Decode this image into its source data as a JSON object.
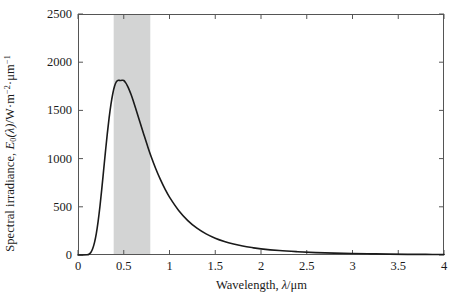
{
  "chart_data": {
    "type": "line",
    "title": "",
    "subtitle": "",
    "xlabel_parts": {
      "name": "Wavelength,",
      "symbol": "λ",
      "slash": "/",
      "unit": "μm"
    },
    "xlabel": "Wavelength, λ/μm",
    "ylabel": "Spectral irradiance, E₀(λ)/W·m⁻²·μm⁻¹",
    "ylabel_parts": {
      "name": "Spectral irradiance,",
      "symbol": "E",
      "subscript": "0",
      "arg": "(λ)",
      "slash": "/",
      "unit1": "W·m",
      "exp1": "−2",
      "dot": "·",
      "unit2": "μm",
      "exp2": "−1"
    },
    "xlim": [
      0,
      4
    ],
    "ylim": [
      0,
      2500
    ],
    "xticks": [
      0,
      0.5,
      1,
      1.5,
      2,
      2.5,
      3,
      3.5,
      4
    ],
    "xtick_labels": [
      "0",
      "0.5",
      "1",
      "1.5",
      "2",
      "2.5",
      "3",
      "3.5",
      "4"
    ],
    "yticks": [
      0,
      500,
      1000,
      1500,
      2000,
      2500
    ],
    "ytick_labels": [
      "0",
      "500",
      "1000",
      "1500",
      "2000",
      "2500"
    ],
    "grid": false,
    "legend": null,
    "legend_position": "none",
    "line_color": "#1a1a1a",
    "line_width": 1.6,
    "frame_color": "#555555",
    "bands": [
      {
        "name": "visible-spectrum-band",
        "x_start": 0.39,
        "x_end": 0.79,
        "color": "#d3d4d4",
        "label": ""
      }
    ],
    "peak": {
      "x": 0.5,
      "y": 1810
    },
    "series": [
      {
        "name": "Extraterrestrial solar spectral irradiance",
        "x": [
          0.0,
          0.05,
          0.1,
          0.12,
          0.14,
          0.16,
          0.18,
          0.2,
          0.22,
          0.24,
          0.26,
          0.28,
          0.3,
          0.32,
          0.34,
          0.36,
          0.38,
          0.4,
          0.42,
          0.44,
          0.46,
          0.48,
          0.5,
          0.52,
          0.54,
          0.56,
          0.58,
          0.6,
          0.64,
          0.68,
          0.72,
          0.76,
          0.8,
          0.85,
          0.9,
          0.95,
          1.0,
          1.1,
          1.2,
          1.3,
          1.4,
          1.5,
          1.6,
          1.7,
          1.8,
          1.9,
          2.0,
          2.2,
          2.4,
          2.6,
          2.8,
          3.0,
          3.2,
          3.4,
          3.6,
          3.8,
          4.0
        ],
        "y": [
          0,
          0,
          2,
          8,
          26,
          64,
          128,
          222,
          349,
          506,
          686,
          879,
          1072,
          1257,
          1422,
          1562,
          1673,
          1753,
          1798,
          1812,
          1810,
          1812,
          1810,
          1788,
          1755,
          1713,
          1664,
          1610,
          1492,
          1369,
          1248,
          1130,
          1019,
          895,
          784,
          686,
          600,
          462,
          357,
          278,
          219,
          174,
          140,
          114,
          93,
          77,
          64,
          46,
          34,
          25,
          19,
          15,
          12,
          9,
          7,
          6,
          5
        ]
      }
    ]
  },
  "axes_geometry": {
    "left_px": 78,
    "right_px": 444,
    "top_px": 14,
    "bottom_px": 255
  }
}
